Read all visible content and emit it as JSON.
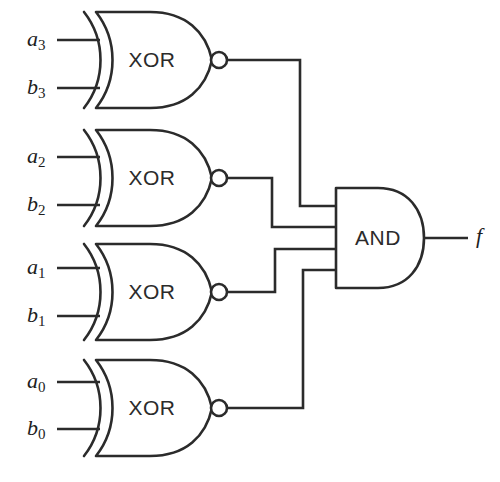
{
  "diagram": {
    "background_color": "#ffffff",
    "line_color": "#2b2b2b",
    "gates": [
      {
        "id": "xor3",
        "type": "XOR",
        "label": "XOR",
        "inverted_output": true,
        "inputs": [
          {
            "name": "a3",
            "base": "a",
            "sub": "3"
          },
          {
            "name": "b3",
            "base": "b",
            "sub": "3"
          }
        ]
      },
      {
        "id": "xor2",
        "type": "XOR",
        "label": "XOR",
        "inverted_output": true,
        "inputs": [
          {
            "name": "a2",
            "base": "a",
            "sub": "2"
          },
          {
            "name": "b2",
            "base": "b",
            "sub": "2"
          }
        ]
      },
      {
        "id": "xor1",
        "type": "XOR",
        "label": "XOR",
        "inverted_output": true,
        "inputs": [
          {
            "name": "a1",
            "base": "a",
            "sub": "1"
          },
          {
            "name": "b1",
            "base": "b",
            "sub": "1"
          }
        ]
      },
      {
        "id": "xor0",
        "type": "XOR",
        "label": "XOR",
        "inverted_output": true,
        "inputs": [
          {
            "name": "a0",
            "base": "a",
            "sub": "0"
          },
          {
            "name": "b0",
            "base": "b",
            "sub": "0"
          }
        ]
      },
      {
        "id": "and",
        "type": "AND",
        "label": "AND",
        "inverted_output": false,
        "input_count": 4,
        "output": {
          "name": "f",
          "base": "f",
          "sub": ""
        }
      }
    ],
    "output": {
      "name": "f",
      "base": "f",
      "sub": ""
    }
  }
}
